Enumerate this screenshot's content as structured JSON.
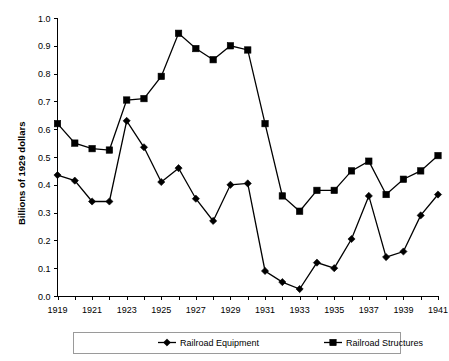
{
  "chart_data": {
    "type": "line",
    "title": "",
    "xlabel": "",
    "ylabel": "Billions of 1929 dollars",
    "xlim": [
      1919,
      1941
    ],
    "ylim": [
      0.0,
      1.0
    ],
    "ytick_step": 0.1,
    "grid": false,
    "legend_position": "bottom",
    "x": [
      1919,
      1920,
      1921,
      1922,
      1923,
      1924,
      1925,
      1926,
      1927,
      1928,
      1929,
      1930,
      1931,
      1932,
      1933,
      1934,
      1935,
      1936,
      1937,
      1938,
      1939,
      1940,
      1941
    ],
    "xtick_labels": [
      "1919",
      "",
      "1921",
      "",
      "1923",
      "",
      "1925",
      "",
      "1927",
      "",
      "1929",
      "",
      "1931",
      "",
      "1933",
      "",
      "1935",
      "",
      "1937",
      "",
      "1939",
      "",
      "1941"
    ],
    "ytick_labels": [
      "0.0",
      "0.1",
      "0.2",
      "0.3",
      "0.4",
      "0.5",
      "0.6",
      "0.7",
      "0.8",
      "0.9",
      "1.0"
    ],
    "ytick_values": [
      0.0,
      0.1,
      0.2,
      0.3,
      0.4,
      0.5,
      0.6,
      0.7,
      0.8,
      0.9,
      1.0
    ],
    "series": [
      {
        "name": "Railroad Equipment",
        "marker": "diamond",
        "color": "#000000",
        "values": [
          0.435,
          0.415,
          0.34,
          0.34,
          0.63,
          0.535,
          0.41,
          0.46,
          0.35,
          0.27,
          0.4,
          0.405,
          0.09,
          0.05,
          0.025,
          0.12,
          0.1,
          0.205,
          0.36,
          0.14,
          0.16,
          0.29,
          0.365
        ]
      },
      {
        "name": "Railroad Structures",
        "marker": "square",
        "color": "#000000",
        "values": [
          0.62,
          0.55,
          0.53,
          0.525,
          0.705,
          0.71,
          0.79,
          0.945,
          0.89,
          0.85,
          0.9,
          0.885,
          0.62,
          0.36,
          0.305,
          0.38,
          0.38,
          0.45,
          0.485,
          0.365,
          0.42,
          0.45,
          0.505
        ]
      }
    ]
  },
  "legend": {
    "items": [
      {
        "label": "Railroad Equipment",
        "marker": "diamond"
      },
      {
        "label": "Railroad Structures",
        "marker": "square"
      }
    ]
  }
}
